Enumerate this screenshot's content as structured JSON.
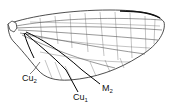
{
  "figure": {
    "labels": [
      {
        "id": "cu2",
        "base": "Cu",
        "sub": "2"
      },
      {
        "id": "cu1",
        "base": "Cu",
        "sub": "1"
      },
      {
        "id": "m2",
        "base": "M",
        "sub": "2"
      }
    ]
  }
}
